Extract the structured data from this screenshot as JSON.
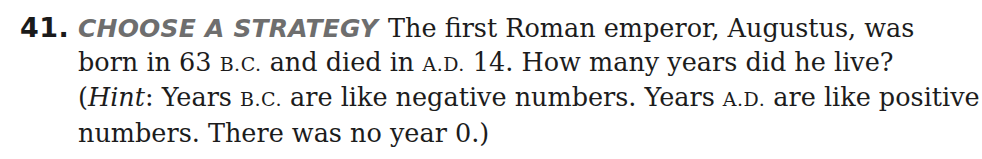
{
  "exercise": {
    "number": "41.",
    "heading": "CHOOSE A STRATEGY",
    "lines": [
      {
        "a": "The first Roman emperor, Augustus, was"
      },
      {
        "a": "born in 63 ",
        "sc1": "B.C.",
        "b": " and died in ",
        "sc2": "A.D.",
        "c": " 14. How many years did he live?"
      },
      {
        "a": "(",
        "hint": "Hint",
        "b": ": Years ",
        "sc1": "B.C.",
        "c": " are like negative numbers. Years ",
        "sc2": "A.D.",
        "d": " are like positive"
      },
      {
        "a": "numbers. There was no year 0.)"
      }
    ]
  }
}
